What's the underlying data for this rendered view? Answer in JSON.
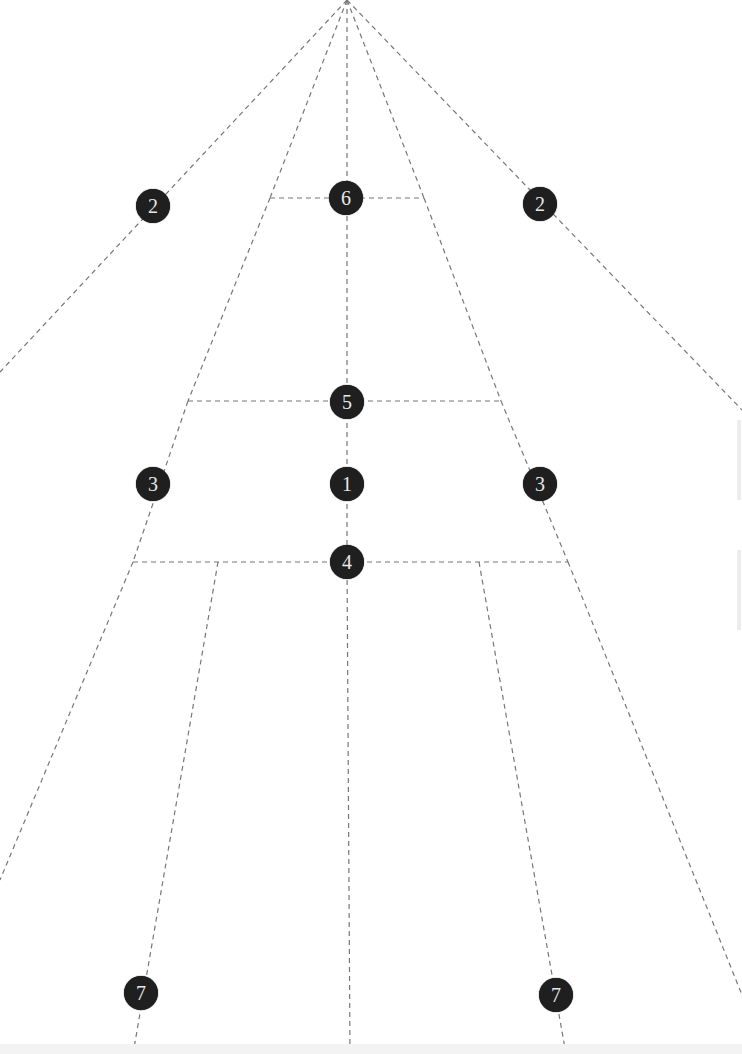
{
  "diagram": {
    "apex": {
      "x": 347,
      "y": 0
    },
    "line_color": "#777777",
    "marker_color": "#1f1f1f",
    "marker_text_color": "#e8e8e8",
    "lines": [
      {
        "id": "fan-far-left",
        "x1": 347,
        "y1": 0,
        "x2": 0,
        "y2": 372
      },
      {
        "id": "fan-inner-left",
        "x1": 347,
        "y1": 0,
        "x2": 270,
        "y2": 198
      },
      {
        "id": "fan-center",
        "x1": 347,
        "y1": 0,
        "x2": 347,
        "y2": 185
      },
      {
        "id": "fan-inner-right",
        "x1": 347,
        "y1": 0,
        "x2": 424,
        "y2": 198
      },
      {
        "id": "fan-far-right",
        "x1": 347,
        "y1": 0,
        "x2": 742,
        "y2": 410
      },
      {
        "id": "left-side-upper",
        "x1": 270,
        "y1": 198,
        "x2": 188,
        "y2": 401
      },
      {
        "id": "left-side-mid",
        "x1": 188,
        "y1": 401,
        "x2": 133,
        "y2": 562
      },
      {
        "id": "left-side-lower",
        "x1": 133,
        "y1": 562,
        "x2": 0,
        "y2": 880
      },
      {
        "id": "right-side-upper",
        "x1": 424,
        "y1": 198,
        "x2": 501,
        "y2": 401
      },
      {
        "id": "right-side-mid",
        "x1": 501,
        "y1": 401,
        "x2": 568,
        "y2": 562
      },
      {
        "id": "right-side-lower",
        "x1": 568,
        "y1": 562,
        "x2": 742,
        "y2": 995
      },
      {
        "id": "top-crossbar",
        "x1": 270,
        "y1": 198,
        "x2": 424,
        "y2": 198
      },
      {
        "id": "middle-crossbar",
        "x1": 188,
        "y1": 401,
        "x2": 501,
        "y2": 401
      },
      {
        "id": "lower-crossbar",
        "x1": 133,
        "y1": 562,
        "x2": 568,
        "y2": 562
      },
      {
        "id": "center-vertical-upper",
        "x1": 347,
        "y1": 198,
        "x2": 347,
        "y2": 562
      },
      {
        "id": "center-vertical-lower",
        "x1": 347,
        "y1": 562,
        "x2": 350,
        "y2": 1054
      },
      {
        "id": "left-leg",
        "x1": 218,
        "y1": 562,
        "x2": 133,
        "y2": 1054
      },
      {
        "id": "right-leg",
        "x1": 479,
        "y1": 562,
        "x2": 566,
        "y2": 1054
      }
    ],
    "markers": [
      {
        "id": "marker-2-left",
        "label": "2",
        "x": 153,
        "y": 206
      },
      {
        "id": "marker-6",
        "label": "6",
        "x": 346,
        "y": 198
      },
      {
        "id": "marker-2-right",
        "label": "2",
        "x": 540,
        "y": 204
      },
      {
        "id": "marker-5",
        "label": "5",
        "x": 347,
        "y": 402
      },
      {
        "id": "marker-3-left",
        "label": "3",
        "x": 153,
        "y": 484
      },
      {
        "id": "marker-1",
        "label": "1",
        "x": 347,
        "y": 484
      },
      {
        "id": "marker-3-right",
        "label": "3",
        "x": 540,
        "y": 484
      },
      {
        "id": "marker-4",
        "label": "4",
        "x": 347,
        "y": 562
      },
      {
        "id": "marker-7-left",
        "label": "7",
        "x": 141,
        "y": 993
      },
      {
        "id": "marker-7-right",
        "label": "7",
        "x": 556,
        "y": 995
      }
    ]
  }
}
